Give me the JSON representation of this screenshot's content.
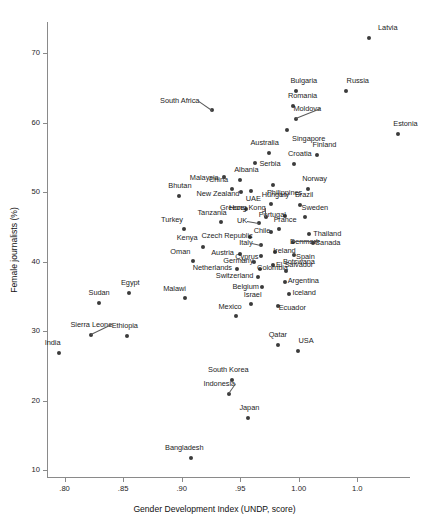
{
  "chart_data": {
    "type": "scatter",
    "title": "",
    "xlabel": "Gender Development Index (UNDP, score)",
    "ylabel": "Female journalists (%)",
    "xlim": [
      0.785,
      1.095
    ],
    "ylim": [
      9.0,
      74.5
    ],
    "xticks": [
      ".80",
      ".85",
      ".90",
      ".95",
      "1.00",
      "1.0"
    ],
    "xtick_values": [
      0.8,
      0.85,
      0.9,
      0.95,
      1.0,
      1.05
    ],
    "yticks": [
      "10",
      "20",
      "30",
      "40",
      "50",
      "60",
      "70"
    ],
    "ytick_values": [
      10,
      20,
      30,
      40,
      50,
      60,
      70
    ],
    "grid": false,
    "legend": false,
    "marker_color": "#3b3b3b",
    "axis_color": "#8a8a8a",
    "points": [
      {
        "label": "Latvia",
        "x": 1.06,
        "y": 72.2,
        "lx": 9,
        "ly": -10
      },
      {
        "label": "Russia",
        "x": 1.04,
        "y": 64.5,
        "lx": 1,
        "ly": -10
      },
      {
        "label": "Bulgaria",
        "x": 0.998,
        "y": 64.6,
        "lx": -6,
        "ly": -10
      },
      {
        "label": "Romania",
        "x": 0.995,
        "y": 62.4,
        "lx": -5,
        "ly": -10
      },
      {
        "label": "South Africa",
        "x": 0.926,
        "y": 61.9,
        "lx": -52,
        "ly": -9,
        "lead": true
      },
      {
        "label": "Moldova",
        "x": 0.998,
        "y": 60.6,
        "lx": -3,
        "ly": -10,
        "lead": true
      },
      {
        "label": "Estonia",
        "x": 1.085,
        "y": 58.4,
        "lx": -5,
        "ly": -10
      },
      {
        "label": "Singapore",
        "x": 0.99,
        "y": 59.0,
        "lx": 5,
        "ly": 9
      },
      {
        "label": "Finland",
        "x": 1.016,
        "y": 55.4,
        "lx": -5,
        "ly": -10
      },
      {
        "label": "Australia",
        "x": 0.975,
        "y": 55.6,
        "lx": -19,
        "ly": -10
      },
      {
        "label": "Croatia",
        "x": 0.996,
        "y": 54.0,
        "lx": -6,
        "ly": -10
      },
      {
        "label": "Serbia",
        "x": 0.963,
        "y": 54.2,
        "lx": 4,
        "ly": 1
      },
      {
        "label": "Albania",
        "x": 0.95,
        "y": 51.7,
        "lx": -6,
        "ly": -10
      },
      {
        "label": "Malaysia",
        "x": 0.936,
        "y": 52.2,
        "lx": -34,
        "ly": 1
      },
      {
        "label": "Norway",
        "x": 1.008,
        "y": 50.5,
        "lx": -6,
        "ly": -10
      },
      {
        "label": "China",
        "x": 0.943,
        "y": 50.4,
        "lx": -23,
        "ly": -9
      },
      {
        "label": "Philippines",
        "x": 0.978,
        "y": 51.0,
        "lx": -6,
        "ly": 8
      },
      {
        "label": "Bhutan",
        "x": 0.898,
        "y": 49.5,
        "lx": -11,
        "ly": -10
      },
      {
        "label": "New Zealand",
        "x": 0.951,
        "y": 50.0,
        "lx": -45,
        "ly": 2
      },
      {
        "label": "Hungary",
        "x": 0.976,
        "y": 48.3,
        "lx": -9,
        "ly": -9
      },
      {
        "label": "UAE",
        "x": 0.959,
        "y": 50.1,
        "lx": -5,
        "ly": 8
      },
      {
        "label": "Brazil",
        "x": 1.001,
        "y": 48.2,
        "lx": -5,
        "ly": -10
      },
      {
        "label": "Greece",
        "x": 0.955,
        "y": 47.6,
        "lx": -26,
        "ly": -1
      },
      {
        "label": "Portugal",
        "x": 0.988,
        "y": 46.6,
        "lx": -26,
        "ly": -1
      },
      {
        "label": "Sweden",
        "x": 1.005,
        "y": 46.4,
        "lx": -3,
        "ly": -9
      },
      {
        "label": "Hong Kong",
        "x": 0.972,
        "y": 46.5,
        "lx": -37,
        "ly": -9,
        "lead": true
      },
      {
        "label": "Tanzania",
        "x": 0.934,
        "y": 45.7,
        "lx": -24,
        "ly": -9
      },
      {
        "label": "Turkey",
        "x": 0.902,
        "y": 44.7,
        "lx": -23,
        "ly": -9
      },
      {
        "label": "UK",
        "x": 0.966,
        "y": 45.6,
        "lx": -22,
        "ly": -2,
        "lead": true
      },
      {
        "label": "France",
        "x": 0.983,
        "y": 44.7,
        "lx": -5,
        "ly": -9
      },
      {
        "label": "Thailand",
        "x": 1.009,
        "y": 44.0,
        "lx": 4,
        "ly": 0
      },
      {
        "label": "Chile",
        "x": 0.976,
        "y": 44.2,
        "lx": -17,
        "ly": -1
      },
      {
        "label": "Czech Republic",
        "x": 0.958,
        "y": 43.5,
        "lx": -48,
        "ly": -1
      },
      {
        "label": "Denmark",
        "x": 0.995,
        "y": 42.8,
        "lx": -3,
        "ly": 0,
        "lead": true
      },
      {
        "label": "Canada",
        "x": 1.012,
        "y": 42.7,
        "lx": 2,
        "ly": 0
      },
      {
        "label": "Kenya",
        "x": 0.918,
        "y": 42.1,
        "lx": -26,
        "ly": -9
      },
      {
        "label": "Italy",
        "x": 0.968,
        "y": 42.4,
        "lx": -22,
        "ly": -2,
        "lead": true
      },
      {
        "label": "Ireland",
        "x": 0.98,
        "y": 41.4,
        "lx": -2,
        "ly": -1
      },
      {
        "label": "Spain",
        "x": 0.996,
        "y": 41.0,
        "lx": 2,
        "ly": 2
      },
      {
        "label": "Austria",
        "x": 0.95,
        "y": 41.1,
        "lx": -29,
        "ly": -1
      },
      {
        "label": "Cyprus",
        "x": 0.968,
        "y": 40.8,
        "lx": -26,
        "ly": 1
      },
      {
        "label": "Oman",
        "x": 0.91,
        "y": 40.1,
        "lx": -23,
        "ly": -9
      },
      {
        "label": "Germany",
        "x": 0.962,
        "y": 39.9,
        "lx": -31,
        "ly": -1
      },
      {
        "label": "El Salvador",
        "x": 0.978,
        "y": 39.5,
        "lx": 3,
        "ly": 0
      },
      {
        "label": "Netherlands",
        "x": 0.947,
        "y": 38.9,
        "lx": -44,
        "ly": -1
      },
      {
        "label": "Colombia",
        "x": 0.967,
        "y": 39.0,
        "lx": -3,
        "ly": -1
      },
      {
        "label": "Botswana",
        "x": 0.989,
        "y": 38.6,
        "lx": -3,
        "ly": -9
      },
      {
        "label": "Switzerland",
        "x": 0.965,
        "y": 37.8,
        "lx": -42,
        "ly": -1
      },
      {
        "label": "Argentina",
        "x": 0.988,
        "y": 37.1,
        "lx": 3,
        "ly": -1
      },
      {
        "label": "Belgium",
        "x": 0.969,
        "y": 36.3,
        "lx": -30,
        "ly": 0
      },
      {
        "label": "Iceland",
        "x": 0.992,
        "y": 35.4,
        "lx": 3,
        "ly": -1
      },
      {
        "label": "Egypt",
        "x": 0.855,
        "y": 35.5,
        "lx": -8,
        "ly": -10
      },
      {
        "label": "Malawi",
        "x": 0.903,
        "y": 34.8,
        "lx": -22,
        "ly": -9
      },
      {
        "label": "Sudan",
        "x": 0.829,
        "y": 34.0,
        "lx": -10,
        "ly": -10
      },
      {
        "label": "Israel",
        "x": 0.959,
        "y": 33.9,
        "lx": -7,
        "ly": -9
      },
      {
        "label": "Ecuador",
        "x": 0.982,
        "y": 33.6,
        "lx": 1,
        "ly": 2
      },
      {
        "label": "Mexico",
        "x": 0.946,
        "y": 32.2,
        "lx": -17,
        "ly": -9
      },
      {
        "label": "Sierra Leone",
        "x": 0.823,
        "y": 29.4,
        "lx": -21,
        "ly": -10,
        "lead": true
      },
      {
        "label": "Ethiopia",
        "x": 0.853,
        "y": 29.3,
        "lx": -15,
        "ly": -10
      },
      {
        "label": "India",
        "x": 0.795,
        "y": 26.9,
        "lx": -14,
        "ly": -10
      },
      {
        "label": "USA",
        "x": 0.999,
        "y": 27.2,
        "lx": 1,
        "ly": -10
      },
      {
        "label": "Qatar",
        "x": 0.982,
        "y": 28.0,
        "lx": -9,
        "ly": -10
      },
      {
        "label": "South Korea",
        "x": 0.943,
        "y": 23.0,
        "lx": -24,
        "ly": -10
      },
      {
        "label": "Indonesia",
        "x": 0.94,
        "y": 21.0,
        "lx": -25,
        "ly": -10,
        "lead": true
      },
      {
        "label": "Japan",
        "x": 0.957,
        "y": 17.5,
        "lx": -9,
        "ly": -10
      },
      {
        "label": "Bangladesh",
        "x": 0.908,
        "y": 11.8,
        "lx": -26,
        "ly": -10
      }
    ]
  }
}
